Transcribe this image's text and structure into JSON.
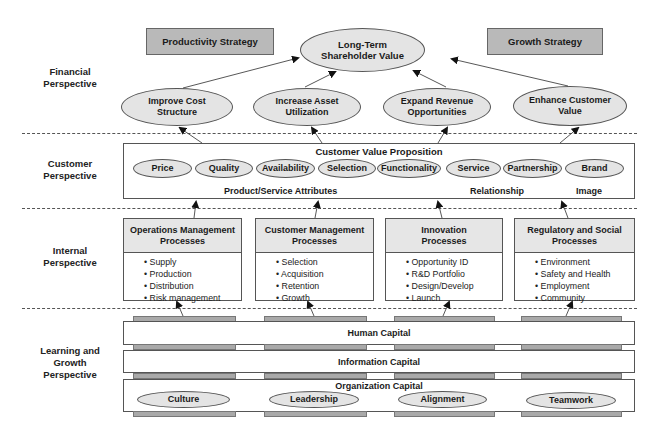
{
  "perspectives": {
    "financial": "Financial\nPerspective",
    "customer": "Customer\nPerspective",
    "internal": "Internal\nPerspective",
    "learning": "Learning and\nGrowth\nPerspective"
  },
  "financial": {
    "productivity_strategy": "Productivity Strategy",
    "growth_strategy": "Growth Strategy",
    "top_goal": "Long-Term Shareholder Value",
    "objectives": [
      {
        "label": "Improve Cost Structure"
      },
      {
        "label": "Increase Asset Utilization"
      },
      {
        "label": "Expand Revenue Opportunities"
      },
      {
        "label": "Enhance Customer Value"
      }
    ]
  },
  "customer": {
    "title": "Customer Value Proposition",
    "attributes": [
      "Price",
      "Quality",
      "Availability",
      "Selection",
      "Functionality",
      "Service",
      "Partnership",
      "Brand"
    ],
    "groups": {
      "product": "Product/Service Attributes",
      "relationship": "Relationship",
      "image": "Image"
    }
  },
  "internal": {
    "processes": [
      {
        "title": "Operations Management Processes",
        "items": [
          "Supply",
          "Production",
          "Distribution",
          "Risk management"
        ]
      },
      {
        "title": "Customer Management Processes",
        "items": [
          "Selection",
          "Acquisition",
          "Retention",
          "Growth"
        ]
      },
      {
        "title": "Innovation Processes",
        "items": [
          "Opportunity ID",
          "R&D Portfolio",
          "Design/Develop",
          "Launch"
        ]
      },
      {
        "title": "Regulatory and Social Processes",
        "items": [
          "Environment",
          "Safety and Health",
          "Employment",
          "Community"
        ]
      }
    ]
  },
  "learning": {
    "human": "Human Capital",
    "information": "Information Capital",
    "organization": "Organization Capital",
    "org_items": [
      "Culture",
      "Leadership",
      "Alignment",
      "Teamwork"
    ]
  },
  "colors": {
    "strategy_fill": "#b9b9b9",
    "ellipse_fill": "#e4e4e4",
    "header_fill": "#e6e6e6",
    "bar_fill": "#a9a9a9",
    "line": "#555555"
  }
}
